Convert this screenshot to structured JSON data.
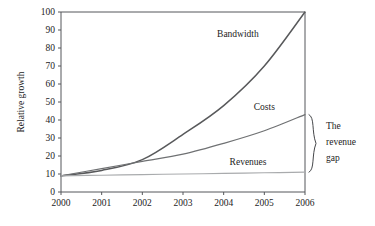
{
  "chart_data": {
    "type": "line",
    "title": "",
    "subtitle": "",
    "xlabel": "",
    "ylabel": "Relative growth",
    "xlim": [
      2000,
      2006
    ],
    "ylim": [
      0,
      100
    ],
    "grid": false,
    "legend_position": "inline-labels",
    "x": [
      2000,
      2001,
      2002,
      2003,
      2004,
      2005,
      2006
    ],
    "xticklabels": [
      "2000",
      "2001",
      "2002",
      "2003",
      "2004",
      "2005",
      "2006"
    ],
    "yticks": [
      0,
      10,
      20,
      30,
      40,
      50,
      60,
      70,
      80,
      90,
      100
    ],
    "yticklabels": [
      "0",
      "10",
      "20",
      "30",
      "40",
      "50",
      "60",
      "70",
      "80",
      "90",
      "100"
    ],
    "series": [
      {
        "name": "Bandwidth",
        "values": [
          9,
          12,
          18,
          32,
          48,
          70,
          100
        ],
        "color": "#58595b",
        "width": 1.5,
        "label_x": 2004.35,
        "label_y": 86
      },
      {
        "name": "Costs",
        "values": [
          9,
          13,
          17,
          21,
          27,
          34,
          43
        ],
        "color": "#6f7173",
        "width": 1.2,
        "label_x": 2005.0,
        "label_y": 45.5
      },
      {
        "name": "Revenues",
        "values": [
          9,
          9.3,
          9.7,
          10.0,
          10.3,
          10.7,
          11
        ],
        "color": "#a9abad",
        "width": 1.2,
        "label_x": 2004.6,
        "label_y": 15
      }
    ],
    "annotations": [
      {
        "name": "revenue-gap",
        "text_lines": [
          "The",
          "revenue",
          "gap"
        ],
        "text": "The revenue gap",
        "brace_from_value": 43,
        "brace_to_value": 11,
        "brace_at_x": 2006
      }
    ]
  }
}
